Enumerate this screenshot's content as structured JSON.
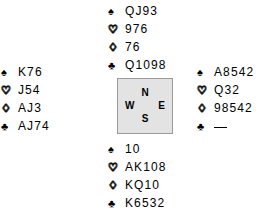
{
  "diagram": {
    "type": "bridge-deal",
    "suit_symbols": {
      "spade": "♠",
      "heart": "♡",
      "diamond": "♢",
      "club": "♣"
    },
    "compass": {
      "north": "N",
      "south": "S",
      "west": "W",
      "east": "E",
      "fill_color": "#e3e3e3",
      "border_color": "#9a9a9a"
    },
    "hands": {
      "north": {
        "label": "North",
        "suits": [
          {
            "suit": "spade",
            "symbol": "♠",
            "cards": "QJ93"
          },
          {
            "suit": "heart",
            "symbol": "♡",
            "cards": "976"
          },
          {
            "suit": "diamond",
            "symbol": "♢",
            "cards": "76"
          },
          {
            "suit": "club",
            "symbol": "♣",
            "cards": "Q1098"
          }
        ]
      },
      "west": {
        "label": "West",
        "suits": [
          {
            "suit": "spade",
            "symbol": "♠",
            "cards": "K76"
          },
          {
            "suit": "heart",
            "symbol": "♡",
            "cards": "J54"
          },
          {
            "suit": "diamond",
            "symbol": "♢",
            "cards": "AJ3"
          },
          {
            "suit": "club",
            "symbol": "♣",
            "cards": "AJ74"
          }
        ]
      },
      "east": {
        "label": "East",
        "suits": [
          {
            "suit": "spade",
            "symbol": "♠",
            "cards": "A8542"
          },
          {
            "suit": "heart",
            "symbol": "♡",
            "cards": "Q32"
          },
          {
            "suit": "diamond",
            "symbol": "♢",
            "cards": "98542"
          },
          {
            "suit": "club",
            "symbol": "♣",
            "cards": "",
            "void": true
          }
        ]
      },
      "south": {
        "label": "South",
        "suits": [
          {
            "suit": "spade",
            "symbol": "♠",
            "cards": "10"
          },
          {
            "suit": "heart",
            "symbol": "♡",
            "cards": "AK108"
          },
          {
            "suit": "diamond",
            "symbol": "♢",
            "cards": "KQ10"
          },
          {
            "suit": "club",
            "symbol": "♣",
            "cards": "K6532"
          }
        ]
      }
    }
  }
}
